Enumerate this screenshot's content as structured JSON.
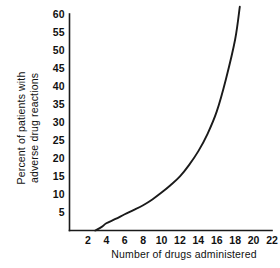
{
  "chart_data": {
    "type": "line",
    "title": "",
    "subtitle": "",
    "xlabel": "Number of drugs administered",
    "ylabel": "Percent of patients with adverse drug reactions",
    "ylabel_line1": "Percent of patients with",
    "ylabel_line2": "adverse drug reactions",
    "xlim": [
      0,
      22
    ],
    "ylim": [
      0,
      60
    ],
    "xticks": [
      2,
      4,
      6,
      8,
      10,
      12,
      14,
      16,
      18,
      20,
      22
    ],
    "xtick_labels": [
      "2",
      "4",
      "6",
      "8",
      "10",
      "12",
      "14",
      "16",
      "18",
      "20",
      "22"
    ],
    "yticks": [
      5,
      10,
      15,
      20,
      25,
      30,
      35,
      40,
      45,
      50,
      55,
      60
    ],
    "ytick_labels": [
      "5",
      "10",
      "15",
      "20",
      "25",
      "30",
      "35",
      "40",
      "45",
      "50",
      "55",
      "60"
    ],
    "grid": false,
    "legend": false,
    "legend_position": "none",
    "line_color": "#1a1a1a",
    "axis_color": "#1a1a1a",
    "background_color": "#ffffff",
    "series": [
      {
        "name": "Percent of patients with adverse drug reactions",
        "x": [
          2.8,
          3.5,
          4.0,
          5.0,
          6.0,
          7.0,
          8.0,
          9.0,
          10.0,
          11.0,
          12.0,
          13.0,
          14.0,
          15.0,
          16.0,
          17.0,
          18.0,
          18.5
        ],
        "values": [
          0.0,
          1.0,
          2.0,
          3.2,
          4.5,
          5.7,
          7.0,
          8.6,
          10.5,
          12.6,
          15.0,
          18.2,
          22.0,
          26.8,
          33.0,
          42.0,
          53.0,
          62.0
        ]
      }
    ]
  },
  "figure": {
    "ytick_font_weight": "bold",
    "xtick_font_weight": "bold"
  }
}
